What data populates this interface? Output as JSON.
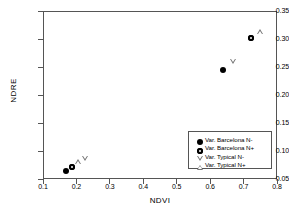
{
  "chart_data": {
    "type": "scatter",
    "title": "",
    "xlabel": "NDVI",
    "ylabel": "NDRE",
    "xlim": [
      0.1,
      0.8
    ],
    "ylim": [
      0.05,
      0.35
    ],
    "xticks": [
      "0.1",
      "0.2",
      "0.3",
      "0.4",
      "0.5",
      "0.6",
      "0.7",
      "0.8"
    ],
    "yticks": [
      "0.05",
      "0.10",
      "0.15",
      "0.20",
      "0.25",
      "0.30",
      "0.35"
    ],
    "xtick_values": [
      0.1,
      0.2,
      0.3,
      0.4,
      0.5,
      0.6,
      0.7,
      0.8
    ],
    "ytick_values": [
      0.05,
      0.1,
      0.15,
      0.2,
      0.25,
      0.3,
      0.35
    ],
    "grid": false,
    "legend_position": "lower-right",
    "series": [
      {
        "name": "Var. Barcelona N-",
        "marker": "filled-circle",
        "marker_class": "m-circle-filled",
        "color": "#000000",
        "points": [
          {
            "x": 0.17,
            "y": 0.065
          },
          {
            "x": 0.638,
            "y": 0.245
          }
        ]
      },
      {
        "name": "Var. Barcelona N+",
        "marker": "circle-with-dot",
        "marker_class": "m-circle-dot",
        "color": "#000000",
        "points": [
          {
            "x": 0.188,
            "y": 0.071
          },
          {
            "x": 0.722,
            "y": 0.301
          }
        ]
      },
      {
        "name": "Var. Typical N-",
        "marker": "open-triangle-down",
        "marker_class": "m-tri-down",
        "color": "#777777",
        "points": [
          {
            "x": 0.227,
            "y": 0.088
          },
          {
            "x": 0.668,
            "y": 0.26
          }
        ]
      },
      {
        "name": "Var. Typical N+",
        "marker": "open-triangle-up",
        "marker_class": "m-tri-up",
        "color": "#777777",
        "points": [
          {
            "x": 0.205,
            "y": 0.08
          },
          {
            "x": 0.748,
            "y": 0.313
          }
        ]
      }
    ]
  }
}
